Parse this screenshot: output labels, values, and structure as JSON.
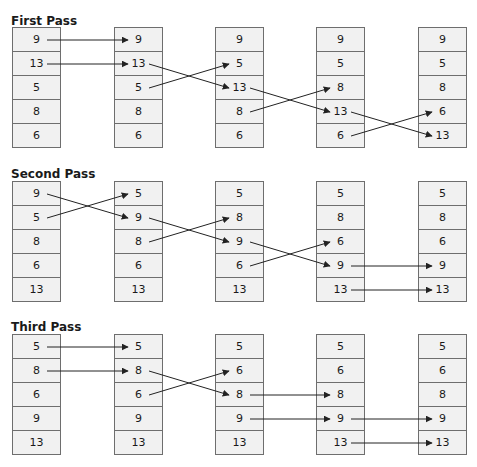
{
  "passes": [
    {
      "title": "First Pass",
      "columns": [
        [
          "9",
          "13",
          "5",
          "8",
          "6"
        ],
        [
          "9",
          "13",
          "5",
          "8",
          "6"
        ],
        [
          "9",
          "5",
          "13",
          "8",
          "6"
        ],
        [
          "9",
          "5",
          "8",
          "13",
          "6"
        ],
        [
          "9",
          "5",
          "8",
          "6",
          "13"
        ]
      ],
      "arrows": [
        {
          "from_col": 0,
          "from_row": 0,
          "to_row": 0
        },
        {
          "from_col": 0,
          "from_row": 1,
          "to_row": 1
        },
        {
          "from_col": 1,
          "from_row": 1,
          "to_row": 2
        },
        {
          "from_col": 1,
          "from_row": 2,
          "to_row": 1
        },
        {
          "from_col": 2,
          "from_row": 2,
          "to_row": 3
        },
        {
          "from_col": 2,
          "from_row": 3,
          "to_row": 2
        },
        {
          "from_col": 3,
          "from_row": 3,
          "to_row": 4
        },
        {
          "from_col": 3,
          "from_row": 4,
          "to_row": 3
        }
      ]
    },
    {
      "title": "Second Pass",
      "columns": [
        [
          "9",
          "5",
          "8",
          "6",
          "13"
        ],
        [
          "5",
          "9",
          "8",
          "6",
          "13"
        ],
        [
          "5",
          "8",
          "9",
          "6",
          "13"
        ],
        [
          "5",
          "8",
          "6",
          "9",
          "13"
        ],
        [
          "5",
          "8",
          "6",
          "9",
          "13"
        ]
      ],
      "arrows": [
        {
          "from_col": 0,
          "from_row": 0,
          "to_row": 1
        },
        {
          "from_col": 0,
          "from_row": 1,
          "to_row": 0
        },
        {
          "from_col": 1,
          "from_row": 1,
          "to_row": 2
        },
        {
          "from_col": 1,
          "from_row": 2,
          "to_row": 1
        },
        {
          "from_col": 2,
          "from_row": 2,
          "to_row": 3
        },
        {
          "from_col": 2,
          "from_row": 3,
          "to_row": 2
        },
        {
          "from_col": 3,
          "from_row": 3,
          "to_row": 3
        },
        {
          "from_col": 3,
          "from_row": 4,
          "to_row": 4
        }
      ]
    },
    {
      "title": "Third Pass",
      "columns": [
        [
          "5",
          "8",
          "6",
          "9",
          "13"
        ],
        [
          "5",
          "8",
          "6",
          "9",
          "13"
        ],
        [
          "5",
          "6",
          "8",
          "9",
          "13"
        ],
        [
          "5",
          "6",
          "8",
          "9",
          "13"
        ],
        [
          "5",
          "6",
          "8",
          "9",
          "13"
        ]
      ],
      "arrows": [
        {
          "from_col": 0,
          "from_row": 0,
          "to_row": 0
        },
        {
          "from_col": 0,
          "from_row": 1,
          "to_row": 1
        },
        {
          "from_col": 1,
          "from_row": 1,
          "to_row": 2
        },
        {
          "from_col": 1,
          "from_row": 2,
          "to_row": 1
        },
        {
          "from_col": 2,
          "from_row": 2,
          "to_row": 2
        },
        {
          "from_col": 2,
          "from_row": 3,
          "to_row": 3
        },
        {
          "from_col": 3,
          "from_row": 3,
          "to_row": 3
        },
        {
          "from_col": 3,
          "from_row": 4,
          "to_row": 4
        }
      ]
    }
  ],
  "colors": {
    "cell_fill": "#f1f1f1",
    "cell_border": "#6e6e6e",
    "arrow": "#222222",
    "text": "#1a1a1a"
  }
}
